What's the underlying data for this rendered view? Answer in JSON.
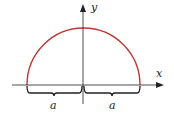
{
  "diagram": {
    "axes": {
      "x_label": "x",
      "y_label": "y"
    },
    "curve": {
      "type": "semicircle",
      "color": "#b83a32"
    },
    "braces": [
      {
        "label": "a",
        "side": "left"
      },
      {
        "label": "a",
        "side": "right"
      }
    ]
  }
}
